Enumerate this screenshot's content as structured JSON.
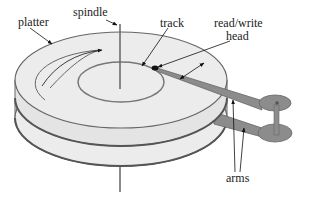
{
  "diagram": {
    "labels": {
      "platter": "platter",
      "spindle": "spindle",
      "track": "track",
      "head_line1": "read/write",
      "head_line2": "head",
      "arms": "arms"
    },
    "colors": {
      "platter_fill": "#ececec",
      "platter_edge": "#6a6a6a",
      "arm_fill": "#8c8c8c",
      "text": "#222222"
    }
  }
}
